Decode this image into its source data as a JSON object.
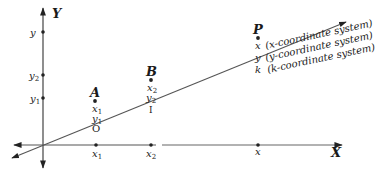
{
  "axes": {
    "x_label": "X",
    "y_label": "Y"
  },
  "y_axis_ticks": [
    {
      "label": "y",
      "sub": ""
    },
    {
      "label": "y",
      "sub": "2"
    },
    {
      "label": "y",
      "sub": "1"
    }
  ],
  "x_axis_ticks": [
    {
      "label": "x",
      "sub": "1"
    },
    {
      "label": "x",
      "sub": "2"
    },
    {
      "label": "x",
      "sub": ""
    }
  ],
  "points": [
    {
      "name": "A",
      "coords": [
        {
          "label": "x",
          "sub": "1"
        },
        {
          "label": "y",
          "sub": "1"
        },
        {
          "label": "O",
          "sub": ""
        }
      ]
    },
    {
      "name": "B",
      "coords": [
        {
          "label": "x",
          "sub": "2"
        },
        {
          "label": "y",
          "sub": "2"
        },
        {
          "label": "I",
          "sub": ""
        }
      ]
    },
    {
      "name": "P",
      "coords": [
        {
          "label": "x",
          "sub": ""
        },
        {
          "label": "y",
          "sub": ""
        },
        {
          "label": "k",
          "sub": ""
        }
      ]
    }
  ],
  "annotations": [
    "(x-coordinate system)",
    "(y-coordinate system)",
    "(k-coordinate system)"
  ],
  "colors": {
    "ink": "#1a1a1a",
    "line": "#555555"
  }
}
